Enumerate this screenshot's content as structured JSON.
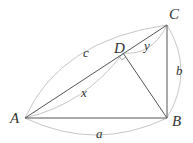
{
  "diagram": {
    "type": "geometry",
    "vertices": {
      "A": "A",
      "B": "B",
      "C": "C",
      "D": "D"
    },
    "segment_labels": {
      "AB": "a",
      "BC": "b",
      "AC": "c",
      "AD": "x",
      "DC": "y"
    },
    "segments": [
      "AB",
      "BC",
      "AC",
      "BD"
    ],
    "right_angles": [
      "D"
    ],
    "colors": {
      "lines": "#555555",
      "arcs": "#b8b8b8",
      "text": "#333333"
    }
  }
}
